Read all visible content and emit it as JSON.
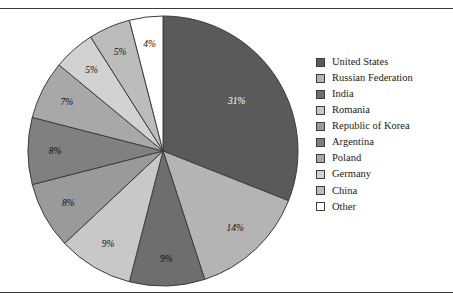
{
  "figure": {
    "background": "#ffffff",
    "rule_color": "#3a3a3a",
    "top_rule": "horizontal-rule",
    "bottom_rule": "horizontal-rule"
  },
  "legend": {
    "position": "right",
    "items": [
      {
        "label": "United States",
        "color": "#5a5a5a"
      },
      {
        "label": "Russian Federation",
        "color": "#b4b4b4"
      },
      {
        "label": "India",
        "color": "#6e6e6e"
      },
      {
        "label": "Romania",
        "color": "#c8c8c8"
      },
      {
        "label": "Republic of Korea",
        "color": "#9a9a9a"
      },
      {
        "label": "Argentina",
        "color": "#808080"
      },
      {
        "label": "Poland",
        "color": "#a8a8a8"
      },
      {
        "label": "Germany",
        "color": "#d2d2d2"
      },
      {
        "label": "China",
        "color": "#bcbcbc"
      },
      {
        "label": "Other",
        "color": "#ffffff"
      }
    ]
  },
  "chart_data": {
    "type": "pie",
    "title": "",
    "start_angle": 0,
    "direction": "clockwise",
    "labels_format": "percent",
    "categories": [
      "United States",
      "Russian Federation",
      "India",
      "Romania",
      "Republic of Korea",
      "Argentina",
      "Poland",
      "Germany",
      "China",
      "Other"
    ],
    "values": [
      31,
      14,
      9,
      9,
      8,
      8,
      7,
      5,
      5,
      4
    ],
    "value_labels": [
      "31%",
      "14%",
      "9%",
      "9%",
      "8%",
      "8%",
      "7%",
      "5%",
      "5%",
      "4%"
    ],
    "colors": [
      "#5a5a5a",
      "#b4b4b4",
      "#6e6e6e",
      "#c8c8c8",
      "#9a9a9a",
      "#808080",
      "#a8a8a8",
      "#d2d2d2",
      "#bcbcbc",
      "#ffffff"
    ],
    "label_text_colors": [
      "on-dark",
      "on-light",
      "on-light",
      "on-light",
      "on-light",
      "on-light",
      "on-light",
      "on-light",
      "on-light",
      "on-light"
    ],
    "slice_border_color": "#3d3d3d",
    "legend_position": "right",
    "grid": false
  }
}
